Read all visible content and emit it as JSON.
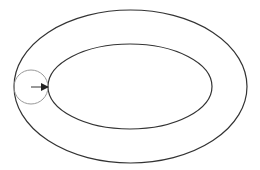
{
  "diagram": {
    "background": "#ffffff",
    "outer_ellipse": {
      "cx": 130.5,
      "cy": 86.5,
      "rx": 116.5,
      "ry": 76.5,
      "stroke": "#333333",
      "stroke_width": 1.2
    },
    "inner_ellipse": {
      "cx": 130,
      "cy": 86.5,
      "rx": 82,
      "ry": 42.5,
      "stroke": "#333333",
      "stroke_width": 1.2
    },
    "small_circle": {
      "cx": 31,
      "cy": 87,
      "r": 17,
      "stroke": "#999999",
      "stroke_width": 1
    },
    "arrow": {
      "x1": 31,
      "y1": 87,
      "x2": 48,
      "y2": 87,
      "stroke": "#333333",
      "stroke_width": 1
    }
  }
}
